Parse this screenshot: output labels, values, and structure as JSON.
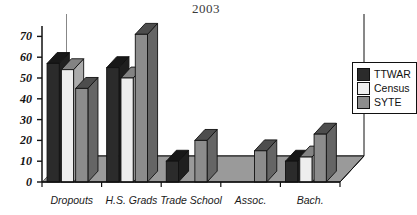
{
  "chart_data": {
    "type": "bar",
    "title": "2003",
    "xlabel": "",
    "ylabel": "",
    "ylim": [
      0,
      75
    ],
    "yticks": [
      0,
      10,
      20,
      30,
      40,
      50,
      60,
      70
    ],
    "grid": true,
    "legend_position": "right",
    "style": "3d-grouped-column",
    "categories": [
      "Dropouts",
      "H.S. Grads",
      "Trade School",
      "Assoc.",
      "Bach."
    ],
    "series": [
      {
        "name": "TTWAR",
        "color": "#2b2b2b",
        "values": [
          57,
          55,
          10,
          0,
          10
        ]
      },
      {
        "name": "Census",
        "color": "#eeeeee",
        "values": [
          54,
          50,
          0,
          0,
          12
        ]
      },
      {
        "name": "SYTE",
        "color": "#8c8c8c",
        "values": [
          45,
          71,
          20,
          15,
          23
        ]
      }
    ]
  },
  "legend": {
    "items": [
      {
        "label": "TTWAR"
      },
      {
        "label": "Census"
      },
      {
        "label": "SYTE"
      }
    ]
  },
  "axis": {
    "y_labels": [
      "0",
      "10",
      "20",
      "30",
      "40",
      "50",
      "60",
      "70"
    ],
    "x_labels": [
      "Dropouts",
      "H.S. Grads",
      "Trade School",
      "Assoc.",
      "Bach."
    ]
  },
  "colors": {
    "ttwar": "#2b2b2b",
    "census": "#eeeeee",
    "syte": "#8c8c8c",
    "floor": "#9a9a9a",
    "wall": "#ffffff",
    "outline": "#111111"
  }
}
